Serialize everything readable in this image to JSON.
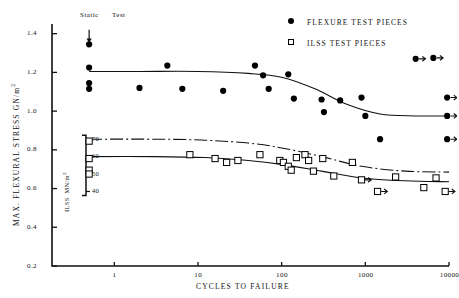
{
  "chart_data": {
    "type": "scatter",
    "title": "",
    "xlabel": "CYCLES TO FAILURE",
    "ylabel": "MAX. FLEXURAL STRESS GN/m",
    "ylabel_sup": "2",
    "xscale": "log",
    "xlim": [
      0.18,
      10000
    ],
    "ylim": [
      0.2,
      1.45
    ],
    "xticks": [
      "1",
      "10",
      "100",
      "1000",
      "10000"
    ],
    "xtick_values": [
      1,
      10,
      100,
      1000,
      10000
    ],
    "yticks": [
      "1.4",
      "1.2",
      "1.0",
      "0.8",
      "0.6",
      "0.4",
      "0.2"
    ],
    "ytick_values": [
      1.4,
      1.2,
      1.0,
      0.8,
      0.6,
      0.4,
      0.2
    ],
    "grid": false,
    "secondary_axis": {
      "label": "ILSS",
      "units": "MN/m",
      "units_sup": "2",
      "ticks": [
        "70",
        "60",
        "50",
        "40"
      ],
      "tick_values": [
        70,
        60,
        50,
        40
      ],
      "tick_y_primary": [
        0.855,
        0.765,
        0.675,
        0.585
      ]
    },
    "annotation": {
      "text_left": "Static",
      "text_right": "Test",
      "arrow": "down-arrow",
      "x": 0.5,
      "y_from": 1.42,
      "y_to": 1.36
    },
    "legend": {
      "position": "top-right",
      "entries": [
        {
          "marker": "filled-circle",
          "label": "FLEXURE TEST PIECES"
        },
        {
          "marker": "open-square",
          "label": "ILSS TEST PIECES"
        }
      ]
    },
    "series": [
      {
        "name": "FLEXURE TEST PIECES",
        "marker": "filled-circle",
        "color": "#000000",
        "points": [
          {
            "x": 0.5,
            "y": 1.345
          },
          {
            "x": 0.5,
            "y": 1.225
          },
          {
            "x": 0.5,
            "y": 1.145
          },
          {
            "x": 0.5,
            "y": 1.115
          },
          {
            "x": 2.0,
            "y": 1.12
          },
          {
            "x": 4.3,
            "y": 1.235
          },
          {
            "x": 6.5,
            "y": 1.115
          },
          {
            "x": 20.0,
            "y": 1.105
          },
          {
            "x": 48.0,
            "y": 1.235
          },
          {
            "x": 60.0,
            "y": 1.185
          },
          {
            "x": 70.0,
            "y": 1.115
          },
          {
            "x": 120.0,
            "y": 1.19
          },
          {
            "x": 140.0,
            "y": 1.065
          },
          {
            "x": 300.0,
            "y": 1.06
          },
          {
            "x": 320.0,
            "y": 0.995
          },
          {
            "x": 500.0,
            "y": 1.055
          },
          {
            "x": 900.0,
            "y": 1.07
          },
          {
            "x": 1000.0,
            "y": 0.975
          },
          {
            "x": 1500.0,
            "y": 0.855
          },
          {
            "x": 4000.0,
            "y": 1.27,
            "runout": true
          },
          {
            "x": 6500.0,
            "y": 1.275,
            "runout": true
          },
          {
            "x": 9500.0,
            "y": 1.07,
            "runout": true
          },
          {
            "x": 9500.0,
            "y": 0.975,
            "runout": true
          },
          {
            "x": 9500.0,
            "y": 0.855,
            "runout": true
          }
        ]
      },
      {
        "name": "ILSS TEST PIECES",
        "marker": "open-square",
        "color": "#000000",
        "points": [
          {
            "x": 0.5,
            "y": 0.845
          },
          {
            "x": 0.5,
            "y": 0.755
          },
          {
            "x": 0.5,
            "y": 0.695
          },
          {
            "x": 0.5,
            "y": 0.675
          },
          {
            "x": 8.0,
            "y": 0.775
          },
          {
            "x": 16.0,
            "y": 0.755
          },
          {
            "x": 22.0,
            "y": 0.735
          },
          {
            "x": 30.0,
            "y": 0.745
          },
          {
            "x": 55.0,
            "y": 0.775
          },
          {
            "x": 95.0,
            "y": 0.745
          },
          {
            "x": 105.0,
            "y": 0.735
          },
          {
            "x": 120.0,
            "y": 0.715
          },
          {
            "x": 130.0,
            "y": 0.695
          },
          {
            "x": 150.0,
            "y": 0.76
          },
          {
            "x": 190.0,
            "y": 0.775
          },
          {
            "x": 210.0,
            "y": 0.745
          },
          {
            "x": 240.0,
            "y": 0.69
          },
          {
            "x": 310.0,
            "y": 0.755
          },
          {
            "x": 420.0,
            "y": 0.665
          },
          {
            "x": 700.0,
            "y": 0.735
          },
          {
            "x": 900.0,
            "y": 0.645,
            "runout": true
          },
          {
            "x": 1400.0,
            "y": 0.585,
            "runout": true
          },
          {
            "x": 2300.0,
            "y": 0.66
          },
          {
            "x": 5000.0,
            "y": 0.605
          },
          {
            "x": 7000.0,
            "y": 0.655
          },
          {
            "x": 9000.0,
            "y": 0.585,
            "runout": true
          }
        ]
      }
    ],
    "curves": [
      {
        "name": "flexure-fit-curve",
        "style": "solid",
        "points": [
          {
            "x": 0.5,
            "y": 1.205
          },
          {
            "x": 2,
            "y": 1.205
          },
          {
            "x": 10,
            "y": 1.205
          },
          {
            "x": 40,
            "y": 1.195
          },
          {
            "x": 100,
            "y": 1.175
          },
          {
            "x": 250,
            "y": 1.115
          },
          {
            "x": 600,
            "y": 1.035
          },
          {
            "x": 1500,
            "y": 0.985
          },
          {
            "x": 4000,
            "y": 0.975
          },
          {
            "x": 10000,
            "y": 0.975
          }
        ]
      },
      {
        "name": "ilss-lower-fit-curve",
        "style": "solid",
        "points": [
          {
            "x": 0.5,
            "y": 0.765
          },
          {
            "x": 3,
            "y": 0.765
          },
          {
            "x": 12,
            "y": 0.76
          },
          {
            "x": 40,
            "y": 0.745
          },
          {
            "x": 100,
            "y": 0.725
          },
          {
            "x": 300,
            "y": 0.69
          },
          {
            "x": 900,
            "y": 0.655
          },
          {
            "x": 3000,
            "y": 0.64
          },
          {
            "x": 10000,
            "y": 0.635
          }
        ]
      },
      {
        "name": "ilss-upper-fit-curve",
        "style": "dash-dot",
        "points": [
          {
            "x": 0.5,
            "y": 0.855
          },
          {
            "x": 3,
            "y": 0.855
          },
          {
            "x": 12,
            "y": 0.85
          },
          {
            "x": 40,
            "y": 0.835
          },
          {
            "x": 100,
            "y": 0.81
          },
          {
            "x": 300,
            "y": 0.765
          },
          {
            "x": 900,
            "y": 0.715
          },
          {
            "x": 3000,
            "y": 0.69
          },
          {
            "x": 10000,
            "y": 0.685
          }
        ]
      }
    ]
  }
}
